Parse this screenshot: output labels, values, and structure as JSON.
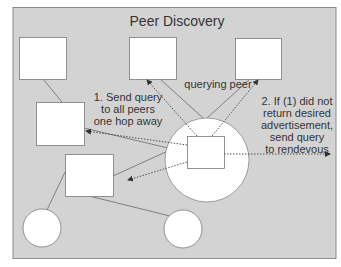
{
  "title": "Peer Discovery",
  "labels": {
    "querying_peer": "querying peer",
    "step1": "1. Send query\nto all peers\none hop away",
    "step2": "2. If (1) did not\nreturn desired\nadvertisement,\nsend query\nto rendevous"
  },
  "colors": {
    "panel_fill": "#d3d3d3",
    "panel_border": "#8a8a8a",
    "node_fill": "#ffffff",
    "node_border": "#7a7a7a",
    "line": "#666666",
    "arrow": "#444444",
    "text": "#333333"
  },
  "nodes": [
    {
      "id": "peer-top-left",
      "shape": "square"
    },
    {
      "id": "peer-top-center",
      "shape": "square"
    },
    {
      "id": "peer-top-right",
      "shape": "square"
    },
    {
      "id": "peer-middle-left",
      "shape": "square"
    },
    {
      "id": "peer-lower-left",
      "shape": "square"
    },
    {
      "id": "querying-peer",
      "shape": "square",
      "label": "querying peer"
    },
    {
      "id": "hop-radius",
      "shape": "circle"
    },
    {
      "id": "peer-bottom-left",
      "shape": "circle"
    },
    {
      "id": "peer-bottom-center",
      "shape": "circle"
    }
  ],
  "edges": [
    {
      "from": "peer-top-left",
      "to": "peer-middle-left",
      "style": "solid"
    },
    {
      "from": "peer-top-center",
      "to": "hop-radius",
      "style": "solid"
    },
    {
      "from": "peer-top-right",
      "to": "hop-radius",
      "style": "solid"
    },
    {
      "from": "peer-middle-left",
      "to": "hop-radius",
      "style": "solid"
    },
    {
      "from": "peer-lower-left",
      "to": "hop-radius",
      "style": "solid"
    },
    {
      "from": "peer-lower-left",
      "to": "peer-bottom-left",
      "style": "solid"
    },
    {
      "from": "peer-lower-left",
      "to": "peer-bottom-center",
      "style": "solid"
    },
    {
      "from": "querying-peer",
      "to": "peer-top-center",
      "style": "dotted-arrow"
    },
    {
      "from": "querying-peer",
      "to": "peer-top-right",
      "style": "dotted-arrow"
    },
    {
      "from": "querying-peer",
      "to": "peer-middle-left",
      "style": "dotted-arrow"
    },
    {
      "from": "querying-peer",
      "to": "peer-lower-left",
      "style": "dotted-arrow"
    },
    {
      "from": "querying-peer",
      "to": "rendezvous",
      "style": "dotted-arrow"
    }
  ]
}
